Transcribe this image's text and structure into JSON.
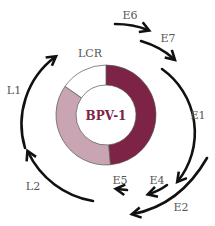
{
  "diagram": {
    "title": "BPV-1",
    "region_label": "LCR",
    "colors": {
      "early_region": "#7d2446",
      "late_region": "#c9a5b3",
      "lcr": "#ffffff",
      "outline": "#555555",
      "arrows": "#111111"
    },
    "ring_segments": [
      {
        "name": "early",
        "color": "#7d2446",
        "start_deg": 0,
        "end_deg": 175
      },
      {
        "name": "late",
        "color": "#c9a5b3",
        "start_deg": 175,
        "end_deg": 305
      },
      {
        "name": "LCR",
        "color": "#ffffff",
        "start_deg": 305,
        "end_deg": 360
      }
    ],
    "genes": [
      {
        "id": "E6",
        "label": "E6"
      },
      {
        "id": "E7",
        "label": "E7"
      },
      {
        "id": "E1",
        "label": "E1"
      },
      {
        "id": "E2",
        "label": "E2"
      },
      {
        "id": "E4",
        "label": "E4"
      },
      {
        "id": "E5",
        "label": "E5"
      },
      {
        "id": "L2",
        "label": "L2"
      },
      {
        "id": "L1",
        "label": "L1"
      }
    ]
  }
}
